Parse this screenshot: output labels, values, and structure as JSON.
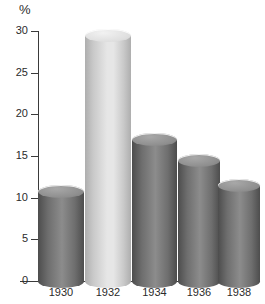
{
  "chart_data": {
    "type": "bar",
    "title": "",
    "subtitle": "",
    "xlabel": "",
    "ylabel": "%",
    "unit_symbol": "%",
    "categories": [
      "1930",
      "1932",
      "1934",
      "1936",
      "1938"
    ],
    "values": [
      10.8,
      29.5,
      17.0,
      14.5,
      11.5
    ],
    "series": [
      {
        "name": "",
        "values": [
          10.8,
          29.5,
          17.0,
          14.5,
          11.5
        ]
      }
    ],
    "ylim": [
      0,
      30
    ],
    "yticks": [
      0,
      5,
      10,
      15,
      20,
      25,
      30
    ],
    "ytick_labels": [
      "0",
      "5",
      "10",
      "15",
      "20",
      "25",
      "30"
    ],
    "grid": false,
    "legend": false,
    "legend_position": "none",
    "bar_style": "3d-cylinder",
    "highlight_index": 1,
    "colors": {
      "bar_default": "#6e6e6e",
      "bar_default_light": "#8c8c8c",
      "bar_default_dark": "#4d4d4d",
      "bar_highlight": "#c9c9c9",
      "bar_highlight_light": "#e6e6e6",
      "bar_highlight_dark": "#aeaeae",
      "top_default": "#8f8f8f",
      "top_highlight": "#dedede",
      "axis": "#3a3a3a",
      "text": "#2b2b2b",
      "background": "#ffffff"
    }
  }
}
